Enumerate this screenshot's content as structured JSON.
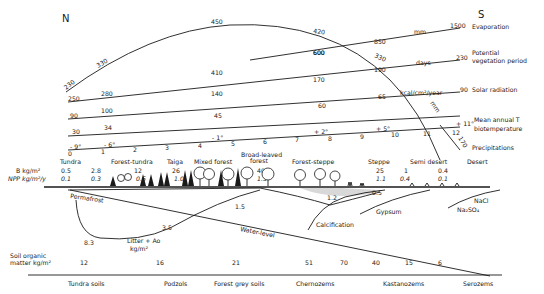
{
  "title": {
    "north": "N",
    "south": "S"
  },
  "gradients": {
    "evaporation": {
      "label": "Evaporation",
      "values": [
        "230",
        "330",
        "450",
        "420",
        "330"
      ],
      "end_value": "1500",
      "unit": "mm"
    },
    "evaporation_upper": {
      "values": [
        "600",
        "850"
      ]
    },
    "vegetation_period": {
      "label_line1": "Potential",
      "label_line2": "vegetation period",
      "values": [
        "250",
        "280",
        "410",
        "600"
      ],
      "mid_value": "170",
      "mid_value2": "190",
      "end_value": "230",
      "unit": "days"
    },
    "solar_radiation": {
      "label": "Solar radiation",
      "values": [
        "90",
        "100",
        "140"
      ],
      "mid_value": "65",
      "end_value": "90",
      "unit": "kcal/cm²/year"
    },
    "radiation_lower": {
      "values": [
        "30",
        "34",
        "45",
        "60"
      ]
    },
    "biotemperature": {
      "label_line1": "Mean annual T",
      "label_line2": "biotemperature",
      "values": [
        "- 9°",
        "- 6°",
        "- 1°",
        "+ 2°",
        "+ 5°",
        "+ 11°"
      ]
    },
    "precipitations": {
      "label": "Precipitations",
      "end_value": "170",
      "unit": "mm"
    },
    "axis_ticks": [
      "0",
      "1",
      "2",
      "3",
      "4",
      "5",
      "6",
      "7",
      "8",
      "9",
      "10",
      "11",
      "12"
    ]
  },
  "zones": {
    "names": [
      "Tundra",
      "Forest-tundra",
      "Taiga",
      "Mixed forest",
      "Broad-leaved",
      "forest",
      "Forest-steppe",
      "Steppe",
      "Semi desert",
      "Desert"
    ],
    "biomass_label": "B  kg/m²",
    "npp_label": "NPP kg/m²/y",
    "biomass": [
      "0.5",
      "2.8",
      "12",
      "26",
      "40",
      "25",
      "1",
      "0.4"
    ],
    "npp": [
      "0.1",
      "0.3",
      "0.5",
      "1.0",
      "1.3",
      "1.1",
      "0.4",
      "0.1"
    ]
  },
  "profile": {
    "permafrost": "Permafrost",
    "litter_label": "Litter + Ao",
    "litter_unit": "kg/m²",
    "litter_values": [
      "8.3",
      "3.5",
      "1.5",
      "1.2",
      "0.5"
    ],
    "water_level": "Water-level",
    "calcification": "Calcification",
    "gypsum": "Gypsum",
    "nacl": "NaCl",
    "na2so4": "Na₂SO₄"
  },
  "soils": {
    "label_line1": "Soil organic",
    "label_line2": "matter  kg/m²",
    "organic_matter": [
      "12",
      "16",
      "21",
      "51",
      "70",
      "40",
      "15",
      "6"
    ],
    "types": [
      "Tundra soils",
      "Podzols",
      "Forest grey soils",
      "Chernozems",
      "Kastanozems",
      "Serozems"
    ]
  }
}
